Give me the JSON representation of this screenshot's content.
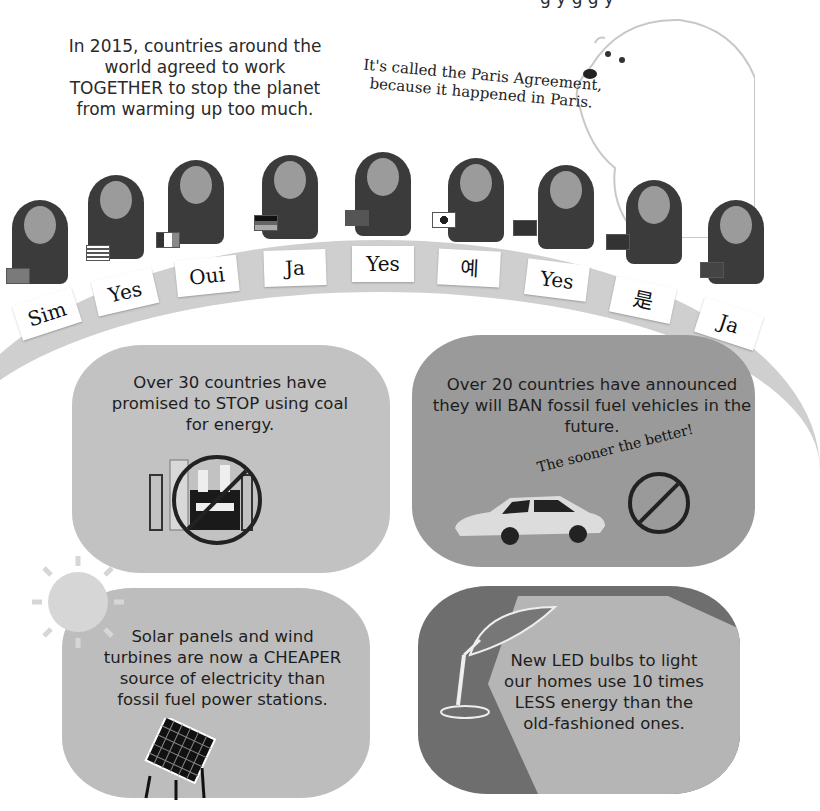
{
  "page": {
    "cut_off_top_text": "g                y g g y",
    "intro_text": "In 2015, countries around the world agreed to work TOGETHER to stop the planet from warming up too much.",
    "bear_quote": "It's called the Paris Agreement, because it happened in Paris."
  },
  "delegates": [
    {
      "country": "Brazil",
      "word": "Sim"
    },
    {
      "country": "United States",
      "word": "Yes"
    },
    {
      "country": "France",
      "word": "Oui"
    },
    {
      "country": "Germany",
      "word": "Ja"
    },
    {
      "country": "South Africa",
      "word": "Yes"
    },
    {
      "country": "South Korea",
      "word": "예"
    },
    {
      "country": "United Kingdom",
      "word": "Yes"
    },
    {
      "country": "China",
      "word": "是"
    },
    {
      "country": "Norway",
      "word": "Ja"
    }
  ],
  "panels": {
    "coal": {
      "text": "Over 30 countries have promised to STOP using coal for energy.",
      "icon": "no-coal-power-station"
    },
    "vehicles": {
      "text": "Over 20 countries have announced they will BAN fossil fuel vehicles in the future.",
      "caption": "The sooner the better!",
      "icon": "car-no-exhaust"
    },
    "solar": {
      "text": "Solar panels and wind turbines are now a CHEAPER source of electricity than fossil fuel power stations.",
      "icon": "solar-panel"
    },
    "led": {
      "text": "New LED bulbs to light our homes use 10 times LESS energy than the old-fashioned ones.",
      "icon": "desk-lamp"
    }
  },
  "colors": {
    "panel_light": "#bcbcbc",
    "panel_dark": "#8a8a8a",
    "table": "#cfcfcf",
    "ink": "#1e1e1e"
  }
}
